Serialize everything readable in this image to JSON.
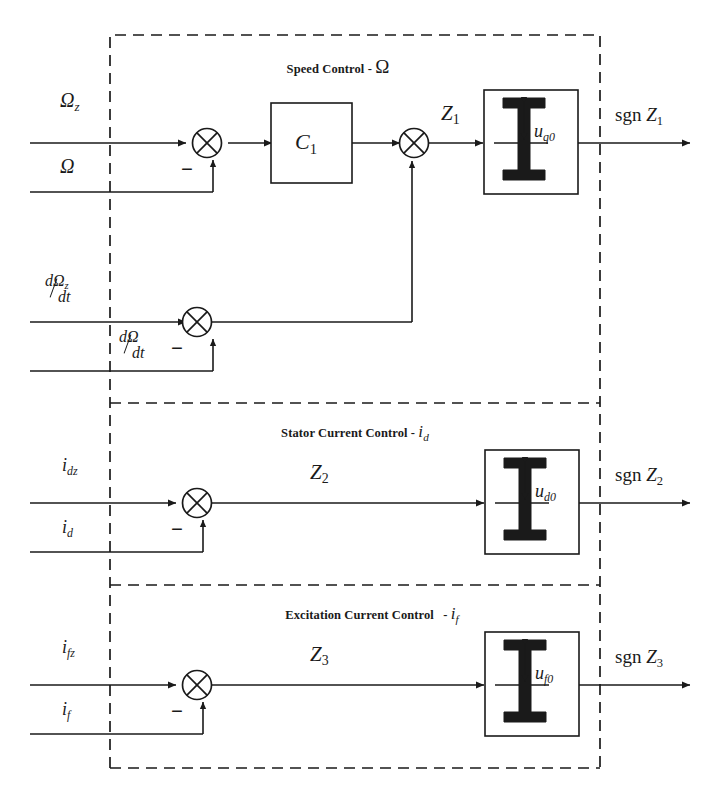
{
  "diagram": {
    "type": "control-block-diagram",
    "line_color": "#1a1a1a",
    "background": "#ffffff"
  },
  "sections": [
    {
      "id": "speed",
      "title_text": "Speed Control",
      "title_dash": "-",
      "title_var": "Ω",
      "inputs": [
        {
          "id": "omega-ref",
          "base": "Ω",
          "sub": "z",
          "sign": "+"
        },
        {
          "id": "omega-fb",
          "base": "Ω",
          "sub": "",
          "sign": "-"
        },
        {
          "id": "domega-ref-dt",
          "num": "dΩ",
          "num_sub": "z",
          "den": "dt",
          "sign": "+"
        },
        {
          "id": "domega-dt",
          "num": "dΩ",
          "num_sub": "",
          "den": "dt",
          "sign": "-"
        }
      ],
      "controller": {
        "base": "C",
        "sub": "1"
      },
      "signal": {
        "base": "Z",
        "sub": "1"
      },
      "relay": {
        "amp_base": "u",
        "amp_sub": "q0"
      },
      "output": {
        "prefix": "sgn",
        "base": "Z",
        "sub": "1"
      },
      "minus_sign": "−"
    },
    {
      "id": "stator-current",
      "title_text": "Stator Current Control",
      "title_dash": "-",
      "title_var_base": "i",
      "title_var_sub": "d",
      "inputs": [
        {
          "id": "id-ref",
          "base": "i",
          "sub": "dz",
          "sign": "+"
        },
        {
          "id": "id-fb",
          "base": "i",
          "sub": "d",
          "sign": "-"
        }
      ],
      "signal": {
        "base": "Z",
        "sub": "2"
      },
      "relay": {
        "amp_base": "u",
        "amp_sub": "d0"
      },
      "output": {
        "prefix": "sgn",
        "base": "Z",
        "sub": "2"
      },
      "minus_sign": "−"
    },
    {
      "id": "excitation-current",
      "title_text": "Excitation Current Control",
      "title_dash": "-",
      "title_var_base": "i",
      "title_var_sub": "f",
      "inputs": [
        {
          "id": "if-ref",
          "base": "i",
          "sub": "fz",
          "sign": "+"
        },
        {
          "id": "if-fb",
          "base": "i",
          "sub": "f",
          "sign": "-"
        }
      ],
      "signal": {
        "base": "Z",
        "sub": "3"
      },
      "relay": {
        "amp_base": "u",
        "amp_sub": "f0"
      },
      "output": {
        "prefix": "sgn",
        "base": "Z",
        "sub": "3"
      },
      "minus_sign": "−"
    }
  ],
  "labels": {
    "omega_z": "Ω",
    "omega_z_sub": "z",
    "omega": "Ω",
    "d_omega_z_num": "dΩ",
    "d_omega_z_num_sub": "z",
    "d_omega_z_den": "dt",
    "d_omega_num": "dΩ",
    "d_omega_den": "dt",
    "C": "C",
    "C_sub": "1",
    "Z1": "Z",
    "Z1_sub": "1",
    "Z2": "Z",
    "Z2_sub": "2",
    "Z3": "Z",
    "Z3_sub": "3",
    "uq0": "u",
    "uq0_sub": "q0",
    "ud0": "u",
    "ud0_sub": "d0",
    "uf0": "u",
    "uf0_sub": "f0",
    "sgn": "sgn",
    "idz": "i",
    "idz_sub": "dz",
    "id": "i",
    "id_sub": "d",
    "ifz": "i",
    "ifz_sub": "fz",
    "if": "i",
    "if_sub": "f",
    "minus": "−",
    "title_speed": "Speed Control",
    "title_stator": "Stator Current Control",
    "title_excitation": "Excitation Current Control",
    "dash": "-"
  }
}
